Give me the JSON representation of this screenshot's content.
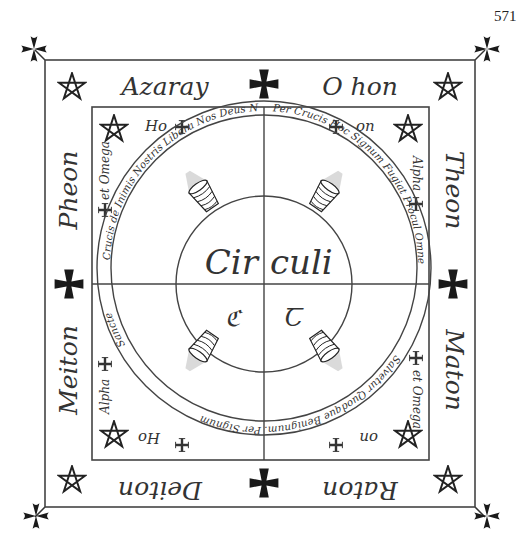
{
  "page_number": "571",
  "outer_square": {
    "top_left_name": "Azaray",
    "top_right_name": "O hon",
    "right_upper_name": "Theon",
    "right_lower_name": "Maton",
    "bottom_right_name": "Raton",
    "bottom_left_name": "Deiton",
    "left_lower_name": "Meiton",
    "left_upper_name": "Pheon"
  },
  "inner_square": {
    "top_left_word": "Ho",
    "top_right_word": "on",
    "bottom_left_word": "Ho",
    "bottom_right_word": "on",
    "left_upper_word": "et Omega",
    "left_lower_word": "Alpha",
    "right_upper_word": "Alpha",
    "right_lower_word": "et Omega"
  },
  "ring_text": {
    "top_left": "Crucis de Inimis Nostris Libera Nos Deus Noster Amen.",
    "top_right": "Per Crucis Hoc Signum Fugiat Procul Omne Malignum et per Idem Signum",
    "bottom": "Salvetur Quodque Benignum. Per Signum",
    "left_lower": "Sancte"
  },
  "center": {
    "word_left": "Cir",
    "word_right": "culi",
    "sigil_left": "ℭ",
    "sigil_right": "Ꞇ"
  },
  "colors": {
    "ink": "#333333",
    "cross_fill": "#1a1a1a"
  }
}
